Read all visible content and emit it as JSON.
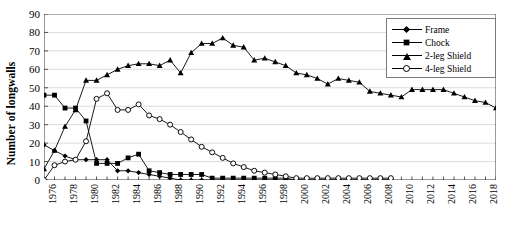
{
  "chart_data": {
    "type": "line",
    "title": "",
    "xlabel": "",
    "ylabel": "Number of longwalls",
    "ylim": [
      0,
      90
    ],
    "ytick_step": 10,
    "yticks": [
      0,
      10,
      20,
      30,
      40,
      50,
      60,
      70,
      80,
      90
    ],
    "xlim": [
      1976,
      2019
    ],
    "xticks": [
      1976,
      1978,
      1980,
      1982,
      1984,
      1986,
      1988,
      1990,
      1992,
      1994,
      1996,
      1998,
      2000,
      2002,
      2004,
      2006,
      2008,
      2010,
      2012,
      2014,
      2016,
      2018
    ],
    "x": [
      1976,
      1977,
      1978,
      1979,
      1980,
      1981,
      1982,
      1983,
      1984,
      1985,
      1986,
      1987,
      1988,
      1989,
      1990,
      1991,
      1992,
      1993,
      1994,
      1995,
      1996,
      1997,
      1998,
      1999,
      2000,
      2001,
      2002,
      2003,
      2004,
      2005,
      2006,
      2007,
      2008,
      2009,
      2010,
      2011,
      2012,
      2013,
      2014,
      2015,
      2016,
      2017,
      2018,
      2019
    ],
    "grid": "horizontal",
    "legend_position": "top-right",
    "series": [
      {
        "name": "Frame",
        "marker": "diamond",
        "color": "#000000",
        "values": [
          19,
          16,
          13,
          11,
          11,
          11,
          11,
          5,
          5,
          4,
          3,
          2,
          1,
          0,
          0,
          0,
          0,
          0,
          0,
          0,
          0,
          0,
          0,
          0,
          0,
          0,
          0,
          0,
          0,
          0,
          0,
          0,
          0,
          0,
          null,
          null,
          null,
          null,
          null,
          null,
          null,
          null,
          null,
          null
        ]
      },
      {
        "name": "Chock",
        "marker": "square",
        "color": "#000000",
        "values": [
          46,
          46,
          39,
          39,
          32,
          9,
          9,
          9,
          12,
          14,
          5,
          4,
          3,
          3,
          3,
          3,
          1,
          1,
          1,
          1,
          1,
          1,
          1,
          1,
          0,
          0,
          0,
          0,
          0,
          0,
          0,
          0,
          0,
          0,
          null,
          null,
          null,
          null,
          null,
          null,
          null,
          null,
          null,
          null
        ]
      },
      {
        "name": "2-leg Shield",
        "marker": "triangle",
        "color": "#000000",
        "values": [
          6,
          16,
          29,
          38,
          54,
          54,
          57,
          60,
          62,
          63,
          63,
          62,
          65,
          58,
          69,
          74,
          74,
          77,
          73,
          72,
          65,
          66,
          64,
          62,
          58,
          57,
          55,
          52,
          55,
          54,
          53,
          48,
          47,
          46,
          45,
          49,
          49,
          49,
          49,
          47,
          45,
          43,
          42,
          39
        ]
      },
      {
        "name": "4-leg Shield",
        "marker": "circle-open",
        "color": "#000000",
        "values": [
          0,
          8,
          10,
          11,
          21,
          44,
          47,
          38,
          38,
          41,
          35,
          33,
          30,
          26,
          22,
          18,
          15,
          12,
          9,
          7,
          5,
          4,
          3,
          2,
          1,
          1,
          1,
          1,
          1,
          1,
          1,
          1,
          1,
          1,
          null,
          null,
          null,
          null,
          null,
          null,
          null,
          null,
          null,
          null
        ]
      }
    ]
  },
  "legend": {
    "items": [
      {
        "label": "Frame",
        "marker": "diamond"
      },
      {
        "label": "Chock",
        "marker": "square"
      },
      {
        "label": "2-leg Shield",
        "marker": "triangle"
      },
      {
        "label": "4-leg Shield",
        "marker": "circle-open"
      }
    ]
  }
}
